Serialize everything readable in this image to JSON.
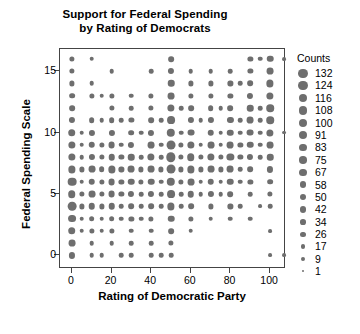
{
  "chart_data": {
    "type": "scatter",
    "title": "Support for Federal Spending by Rating of Democrats",
    "title_lines": [
      "Support for Federal Spending",
      "by Rating of Democrats"
    ],
    "xlabel": "Rating of Democratic Party",
    "ylabel": "Federal Spending Scale",
    "xlim": [
      -6,
      108
    ],
    "ylim": [
      -1.1,
      16.8
    ],
    "xticks": [
      0,
      20,
      40,
      60,
      80,
      100
    ],
    "yticks": [
      0,
      5,
      10,
      15
    ],
    "grid": false,
    "marker_color": "#6e6e6e",
    "size_encoding": "Counts",
    "legend": {
      "title": "Counts",
      "position": "right",
      "entries": [
        132,
        124,
        116,
        108,
        100,
        91,
        83,
        75,
        67,
        58,
        50,
        42,
        34,
        26,
        17,
        9,
        1
      ]
    },
    "size_range": {
      "min_count": 1,
      "max_count": 132,
      "min_px": 2.0,
      "max_px": 9.4
    },
    "points": [
      {
        "x": 0,
        "y": 16,
        "c": 26
      },
      {
        "x": 0,
        "y": 15,
        "c": 26
      },
      {
        "x": 0,
        "y": 14,
        "c": 26
      },
      {
        "x": 0,
        "y": 13,
        "c": 34
      },
      {
        "x": 0,
        "y": 12,
        "c": 34
      },
      {
        "x": 0,
        "y": 11,
        "c": 42
      },
      {
        "x": 0,
        "y": 10,
        "c": 75
      },
      {
        "x": 0,
        "y": 9,
        "c": 67
      },
      {
        "x": 0,
        "y": 8,
        "c": 67
      },
      {
        "x": 0,
        "y": 7,
        "c": 67
      },
      {
        "x": 0,
        "y": 6,
        "c": 108
      },
      {
        "x": 0,
        "y": 5,
        "c": 75
      },
      {
        "x": 0,
        "y": 4,
        "c": 108
      },
      {
        "x": 0,
        "y": 3,
        "c": 83
      },
      {
        "x": 0,
        "y": 2,
        "c": 75
      },
      {
        "x": 0,
        "y": 1,
        "c": 58
      },
      {
        "x": 0,
        "y": 0,
        "c": 42
      },
      {
        "x": 5,
        "y": 10,
        "c": 17
      },
      {
        "x": 5,
        "y": 9,
        "c": 17
      },
      {
        "x": 5,
        "y": 8,
        "c": 17
      },
      {
        "x": 5,
        "y": 7,
        "c": 26
      },
      {
        "x": 5,
        "y": 6,
        "c": 17
      },
      {
        "x": 5,
        "y": 5,
        "c": 26
      },
      {
        "x": 5,
        "y": 4,
        "c": 26
      },
      {
        "x": 5,
        "y": 3,
        "c": 17
      },
      {
        "x": 5,
        "y": 2,
        "c": 17
      },
      {
        "x": 10,
        "y": 16,
        "c": 17
      },
      {
        "x": 10,
        "y": 14,
        "c": 17
      },
      {
        "x": 10,
        "y": 13,
        "c": 26
      },
      {
        "x": 10,
        "y": 11,
        "c": 34
      },
      {
        "x": 10,
        "y": 10,
        "c": 42
      },
      {
        "x": 10,
        "y": 9,
        "c": 50
      },
      {
        "x": 10,
        "y": 8,
        "c": 42
      },
      {
        "x": 10,
        "y": 7,
        "c": 58
      },
      {
        "x": 10,
        "y": 6,
        "c": 50
      },
      {
        "x": 10,
        "y": 5,
        "c": 58
      },
      {
        "x": 10,
        "y": 4,
        "c": 50
      },
      {
        "x": 10,
        "y": 3,
        "c": 34
      },
      {
        "x": 10,
        "y": 2,
        "c": 26
      },
      {
        "x": 10,
        "y": 1,
        "c": 17
      },
      {
        "x": 10,
        "y": 0,
        "c": 17
      },
      {
        "x": 15,
        "y": 13,
        "c": 17
      },
      {
        "x": 15,
        "y": 11,
        "c": 17
      },
      {
        "x": 15,
        "y": 9,
        "c": 26
      },
      {
        "x": 15,
        "y": 8,
        "c": 26
      },
      {
        "x": 15,
        "y": 7,
        "c": 34
      },
      {
        "x": 15,
        "y": 6,
        "c": 26
      },
      {
        "x": 15,
        "y": 5,
        "c": 26
      },
      {
        "x": 15,
        "y": 4,
        "c": 26
      },
      {
        "x": 15,
        "y": 3,
        "c": 17
      },
      {
        "x": 15,
        "y": 2,
        "c": 17
      },
      {
        "x": 15,
        "y": 0,
        "c": 17
      },
      {
        "x": 20,
        "y": 15,
        "c": 17
      },
      {
        "x": 20,
        "y": 13,
        "c": 26
      },
      {
        "x": 20,
        "y": 12,
        "c": 26
      },
      {
        "x": 20,
        "y": 11,
        "c": 34
      },
      {
        "x": 20,
        "y": 10,
        "c": 42
      },
      {
        "x": 20,
        "y": 9,
        "c": 58
      },
      {
        "x": 20,
        "y": 8,
        "c": 50
      },
      {
        "x": 20,
        "y": 7,
        "c": 67
      },
      {
        "x": 20,
        "y": 6,
        "c": 58
      },
      {
        "x": 20,
        "y": 5,
        "c": 58
      },
      {
        "x": 20,
        "y": 4,
        "c": 50
      },
      {
        "x": 20,
        "y": 3,
        "c": 34
      },
      {
        "x": 20,
        "y": 2,
        "c": 26
      },
      {
        "x": 20,
        "y": 1,
        "c": 17
      },
      {
        "x": 25,
        "y": 11,
        "c": 17
      },
      {
        "x": 25,
        "y": 9,
        "c": 17
      },
      {
        "x": 25,
        "y": 8,
        "c": 26
      },
      {
        "x": 25,
        "y": 7,
        "c": 26
      },
      {
        "x": 25,
        "y": 6,
        "c": 26
      },
      {
        "x": 25,
        "y": 5,
        "c": 26
      },
      {
        "x": 25,
        "y": 4,
        "c": 17
      },
      {
        "x": 25,
        "y": 3,
        "c": 17
      },
      {
        "x": 25,
        "y": 0,
        "c": 17
      },
      {
        "x": 30,
        "y": 13,
        "c": 17
      },
      {
        "x": 30,
        "y": 12,
        "c": 17
      },
      {
        "x": 30,
        "y": 11,
        "c": 26
      },
      {
        "x": 30,
        "y": 10,
        "c": 34
      },
      {
        "x": 30,
        "y": 9,
        "c": 42
      },
      {
        "x": 30,
        "y": 8,
        "c": 50
      },
      {
        "x": 30,
        "y": 7,
        "c": 58
      },
      {
        "x": 30,
        "y": 6,
        "c": 50
      },
      {
        "x": 30,
        "y": 5,
        "c": 42
      },
      {
        "x": 30,
        "y": 4,
        "c": 34
      },
      {
        "x": 30,
        "y": 3,
        "c": 26
      },
      {
        "x": 30,
        "y": 2,
        "c": 17
      },
      {
        "x": 30,
        "y": 1,
        "c": 17
      },
      {
        "x": 30,
        "y": 0,
        "c": 17
      },
      {
        "x": 35,
        "y": 10,
        "c": 17
      },
      {
        "x": 35,
        "y": 8,
        "c": 17
      },
      {
        "x": 35,
        "y": 7,
        "c": 26
      },
      {
        "x": 35,
        "y": 6,
        "c": 26
      },
      {
        "x": 35,
        "y": 5,
        "c": 17
      },
      {
        "x": 35,
        "y": 4,
        "c": 17
      },
      {
        "x": 35,
        "y": 3,
        "c": 17
      },
      {
        "x": 40,
        "y": 15,
        "c": 17
      },
      {
        "x": 40,
        "y": 13,
        "c": 26
      },
      {
        "x": 40,
        "y": 12,
        "c": 26
      },
      {
        "x": 40,
        "y": 11,
        "c": 34
      },
      {
        "x": 40,
        "y": 10,
        "c": 42
      },
      {
        "x": 40,
        "y": 9,
        "c": 58
      },
      {
        "x": 40,
        "y": 8,
        "c": 67
      },
      {
        "x": 40,
        "y": 7,
        "c": 58
      },
      {
        "x": 40,
        "y": 6,
        "c": 50
      },
      {
        "x": 40,
        "y": 5,
        "c": 42
      },
      {
        "x": 40,
        "y": 4,
        "c": 34
      },
      {
        "x": 40,
        "y": 3,
        "c": 26
      },
      {
        "x": 40,
        "y": 2,
        "c": 17
      },
      {
        "x": 40,
        "y": 1,
        "c": 17
      },
      {
        "x": 40,
        "y": 0,
        "c": 17
      },
      {
        "x": 45,
        "y": 11,
        "c": 17
      },
      {
        "x": 45,
        "y": 9,
        "c": 17
      },
      {
        "x": 45,
        "y": 8,
        "c": 17
      },
      {
        "x": 45,
        "y": 7,
        "c": 26
      },
      {
        "x": 45,
        "y": 6,
        "c": 17
      },
      {
        "x": 45,
        "y": 5,
        "c": 17
      },
      {
        "x": 45,
        "y": 4,
        "c": 17
      },
      {
        "x": 45,
        "y": 0,
        "c": 17
      },
      {
        "x": 50,
        "y": 16,
        "c": 34
      },
      {
        "x": 50,
        "y": 15,
        "c": 42
      },
      {
        "x": 50,
        "y": 14,
        "c": 50
      },
      {
        "x": 50,
        "y": 13,
        "c": 58
      },
      {
        "x": 50,
        "y": 12,
        "c": 67
      },
      {
        "x": 50,
        "y": 11,
        "c": 83
      },
      {
        "x": 50,
        "y": 10,
        "c": 100
      },
      {
        "x": 50,
        "y": 9,
        "c": 116
      },
      {
        "x": 50,
        "y": 8,
        "c": 132
      },
      {
        "x": 50,
        "y": 7,
        "c": 116
      },
      {
        "x": 50,
        "y": 6,
        "c": 100
      },
      {
        "x": 50,
        "y": 5,
        "c": 83
      },
      {
        "x": 50,
        "y": 4,
        "c": 67
      },
      {
        "x": 50,
        "y": 3,
        "c": 50
      },
      {
        "x": 50,
        "y": 2,
        "c": 34
      },
      {
        "x": 50,
        "y": 1,
        "c": 26
      },
      {
        "x": 50,
        "y": 0,
        "c": 17
      },
      {
        "x": 55,
        "y": 12,
        "c": 17
      },
      {
        "x": 55,
        "y": 10,
        "c": 17
      },
      {
        "x": 55,
        "y": 9,
        "c": 26
      },
      {
        "x": 55,
        "y": 8,
        "c": 26
      },
      {
        "x": 55,
        "y": 7,
        "c": 26
      },
      {
        "x": 55,
        "y": 6,
        "c": 26
      },
      {
        "x": 55,
        "y": 5,
        "c": 17
      },
      {
        "x": 55,
        "y": 4,
        "c": 17
      },
      {
        "x": 60,
        "y": 15,
        "c": 17
      },
      {
        "x": 60,
        "y": 14,
        "c": 26
      },
      {
        "x": 60,
        "y": 13,
        "c": 26
      },
      {
        "x": 60,
        "y": 12,
        "c": 34
      },
      {
        "x": 60,
        "y": 11,
        "c": 42
      },
      {
        "x": 60,
        "y": 10,
        "c": 58
      },
      {
        "x": 60,
        "y": 9,
        "c": 67
      },
      {
        "x": 60,
        "y": 8,
        "c": 75
      },
      {
        "x": 60,
        "y": 7,
        "c": 67
      },
      {
        "x": 60,
        "y": 6,
        "c": 58
      },
      {
        "x": 60,
        "y": 5,
        "c": 50
      },
      {
        "x": 60,
        "y": 4,
        "c": 34
      },
      {
        "x": 60,
        "y": 3,
        "c": 26
      },
      {
        "x": 60,
        "y": 2,
        "c": 17
      },
      {
        "x": 65,
        "y": 11,
        "c": 17
      },
      {
        "x": 65,
        "y": 9,
        "c": 17
      },
      {
        "x": 65,
        "y": 8,
        "c": 26
      },
      {
        "x": 65,
        "y": 7,
        "c": 26
      },
      {
        "x": 65,
        "y": 6,
        "c": 17
      },
      {
        "x": 65,
        "y": 5,
        "c": 17
      },
      {
        "x": 70,
        "y": 15,
        "c": 17
      },
      {
        "x": 70,
        "y": 14,
        "c": 26
      },
      {
        "x": 70,
        "y": 13,
        "c": 26
      },
      {
        "x": 70,
        "y": 12,
        "c": 34
      },
      {
        "x": 70,
        "y": 11,
        "c": 42
      },
      {
        "x": 70,
        "y": 10,
        "c": 50
      },
      {
        "x": 70,
        "y": 9,
        "c": 58
      },
      {
        "x": 70,
        "y": 8,
        "c": 67
      },
      {
        "x": 70,
        "y": 7,
        "c": 58
      },
      {
        "x": 70,
        "y": 6,
        "c": 50
      },
      {
        "x": 70,
        "y": 5,
        "c": 42
      },
      {
        "x": 70,
        "y": 4,
        "c": 26
      },
      {
        "x": 70,
        "y": 3,
        "c": 17
      },
      {
        "x": 75,
        "y": 12,
        "c": 17
      },
      {
        "x": 75,
        "y": 10,
        "c": 17
      },
      {
        "x": 75,
        "y": 9,
        "c": 17
      },
      {
        "x": 75,
        "y": 8,
        "c": 26
      },
      {
        "x": 75,
        "y": 7,
        "c": 26
      },
      {
        "x": 75,
        "y": 6,
        "c": 17
      },
      {
        "x": 75,
        "y": 5,
        "c": 17
      },
      {
        "x": 80,
        "y": 15,
        "c": 17
      },
      {
        "x": 80,
        "y": 14,
        "c": 26
      },
      {
        "x": 80,
        "y": 13,
        "c": 26
      },
      {
        "x": 80,
        "y": 12,
        "c": 34
      },
      {
        "x": 80,
        "y": 11,
        "c": 42
      },
      {
        "x": 80,
        "y": 10,
        "c": 50
      },
      {
        "x": 80,
        "y": 9,
        "c": 58
      },
      {
        "x": 80,
        "y": 8,
        "c": 67
      },
      {
        "x": 80,
        "y": 7,
        "c": 58
      },
      {
        "x": 80,
        "y": 6,
        "c": 50
      },
      {
        "x": 80,
        "y": 5,
        "c": 34
      },
      {
        "x": 80,
        "y": 4,
        "c": 26
      },
      {
        "x": 80,
        "y": 3,
        "c": 17
      },
      {
        "x": 85,
        "y": 14,
        "c": 17
      },
      {
        "x": 85,
        "y": 11,
        "c": 17
      },
      {
        "x": 85,
        "y": 10,
        "c": 17
      },
      {
        "x": 85,
        "y": 9,
        "c": 26
      },
      {
        "x": 85,
        "y": 8,
        "c": 26
      },
      {
        "x": 85,
        "y": 7,
        "c": 17
      },
      {
        "x": 85,
        "y": 6,
        "c": 17
      },
      {
        "x": 85,
        "y": 4,
        "c": 17
      },
      {
        "x": 90,
        "y": 16,
        "c": 26
      },
      {
        "x": 90,
        "y": 15,
        "c": 26
      },
      {
        "x": 90,
        "y": 14,
        "c": 34
      },
      {
        "x": 90,
        "y": 13,
        "c": 42
      },
      {
        "x": 90,
        "y": 12,
        "c": 50
      },
      {
        "x": 90,
        "y": 11,
        "c": 58
      },
      {
        "x": 90,
        "y": 10,
        "c": 58
      },
      {
        "x": 90,
        "y": 9,
        "c": 50
      },
      {
        "x": 90,
        "y": 8,
        "c": 42
      },
      {
        "x": 90,
        "y": 7,
        "c": 34
      },
      {
        "x": 90,
        "y": 6,
        "c": 26
      },
      {
        "x": 90,
        "y": 5,
        "c": 17
      },
      {
        "x": 90,
        "y": 3,
        "c": 17
      },
      {
        "x": 95,
        "y": 16,
        "c": 17
      },
      {
        "x": 95,
        "y": 12,
        "c": 17
      },
      {
        "x": 95,
        "y": 11,
        "c": 17
      },
      {
        "x": 95,
        "y": 10,
        "c": 17
      },
      {
        "x": 95,
        "y": 9,
        "c": 17
      },
      {
        "x": 95,
        "y": 8,
        "c": 17
      },
      {
        "x": 95,
        "y": 4,
        "c": 9
      },
      {
        "x": 100,
        "y": 16,
        "c": 50
      },
      {
        "x": 100,
        "y": 15,
        "c": 58
      },
      {
        "x": 100,
        "y": 14,
        "c": 67
      },
      {
        "x": 100,
        "y": 13,
        "c": 67
      },
      {
        "x": 100,
        "y": 12,
        "c": 75
      },
      {
        "x": 100,
        "y": 11,
        "c": 75
      },
      {
        "x": 100,
        "y": 10,
        "c": 67
      },
      {
        "x": 100,
        "y": 9,
        "c": 58
      },
      {
        "x": 100,
        "y": 8,
        "c": 50
      },
      {
        "x": 100,
        "y": 7,
        "c": 42
      },
      {
        "x": 100,
        "y": 6,
        "c": 34
      },
      {
        "x": 100,
        "y": 5,
        "c": 26
      },
      {
        "x": 100,
        "y": 4,
        "c": 17
      },
      {
        "x": 100,
        "y": 2,
        "c": 9
      },
      {
        "x": 100,
        "y": 0,
        "c": 9
      },
      {
        "x": 107,
        "y": 16,
        "c": 9
      },
      {
        "x": 107,
        "y": 10,
        "c": 9
      },
      {
        "x": 107,
        "y": 0,
        "c": 9
      }
    ]
  }
}
